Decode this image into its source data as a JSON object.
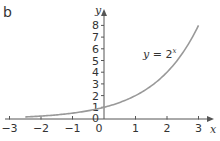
{
  "panel_label": "b",
  "chart_data": {
    "type": "line",
    "title": "",
    "xlabel": "x",
    "ylabel": "y",
    "xlim": [
      -3,
      3
    ],
    "ylim": [
      0,
      8
    ],
    "x_ticks": [
      -3,
      -2,
      -1,
      0,
      1,
      2,
      3
    ],
    "y_ticks": [
      1,
      2,
      3,
      4,
      5,
      6,
      7,
      8
    ],
    "grid": false,
    "series": [
      {
        "name": "y = 2^x",
        "function": "2^x",
        "x_range": [
          -2.5,
          3
        ],
        "x": [
          -2.5,
          -2,
          -1.5,
          -1,
          -0.5,
          0,
          0.5,
          1,
          1.5,
          2,
          2.5,
          3
        ],
        "values": [
          0.18,
          0.25,
          0.35,
          0.5,
          0.71,
          1,
          1.41,
          2,
          2.83,
          4,
          5.66,
          8
        ]
      }
    ],
    "annotations": [
      {
        "text_prefix": "y = 2",
        "superscript": "x",
        "position": "upper-right near curve"
      }
    ]
  },
  "colors": {
    "axis": "#555555",
    "curve": "#999999",
    "text": "#333333"
  }
}
